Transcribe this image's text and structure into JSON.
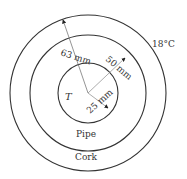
{
  "diagram": {
    "center": {
      "x": 88,
      "y": 93
    },
    "circles": [
      {
        "name": "pipe-inner-circle",
        "r": 30
      },
      {
        "name": "pipe-outer-circle",
        "r": 58
      },
      {
        "name": "cork-outer-circle",
        "r": 78
      }
    ],
    "labels": {
      "inner_temp": "T",
      "ambient_temp": "18°C",
      "pipe": "Pipe",
      "cork": "Cork",
      "r_inner": "25 mm",
      "r_pipe": "50 mm",
      "r_cork": "63 mm"
    },
    "colors": {
      "line": "#333333",
      "dim_line": "#555555",
      "background": "#ffffff"
    }
  }
}
